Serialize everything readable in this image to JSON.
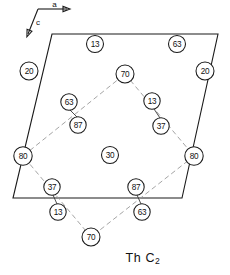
{
  "figure": {
    "caption_main": "Th C",
    "caption_sub": "2",
    "caption_full": "Th C2"
  },
  "axes": {
    "a_label": "a",
    "c_label": "c",
    "origin": {
      "x": 38,
      "y": 9
    },
    "a_tip": {
      "x": 67,
      "y": 9
    },
    "c_tip": {
      "x": 28,
      "y": 34
    }
  },
  "unit_cell": {
    "shape": "parallelogram",
    "stroke": "#1a1a1a",
    "vertices": [
      {
        "x": 52,
        "y": 34
      },
      {
        "x": 218,
        "y": 34
      },
      {
        "x": 182,
        "y": 198
      },
      {
        "x": 13,
        "y": 198
      }
    ]
  },
  "diamond": {
    "stroke": "#9a9a9a",
    "style": "dashed",
    "vertices": [
      {
        "x": 125,
        "y": 74
      },
      {
        "x": 194,
        "y": 156
      },
      {
        "x": 91,
        "y": 237
      },
      {
        "x": 23,
        "y": 156
      }
    ]
  },
  "atoms": [
    {
      "id": "a1",
      "label": "13",
      "x": 95,
      "y": 44,
      "r": 8.5
    },
    {
      "id": "a2",
      "label": "63",
      "x": 177,
      "y": 44,
      "r": 8.5
    },
    {
      "id": "a3",
      "label": "20",
      "x": 29,
      "y": 71,
      "r": 9.0
    },
    {
      "id": "a4",
      "label": "20",
      "x": 205,
      "y": 71,
      "r": 9.0
    },
    {
      "id": "a5",
      "label": "70",
      "x": 125,
      "y": 74,
      "r": 9.0
    },
    {
      "id": "a6",
      "label": "63",
      "x": 69,
      "y": 102,
      "r": 8.2
    },
    {
      "id": "a7",
      "label": "13",
      "x": 152,
      "y": 101,
      "r": 8.2
    },
    {
      "id": "a8",
      "label": "87",
      "x": 78,
      "y": 125,
      "r": 8.2
    },
    {
      "id": "a9",
      "label": "37",
      "x": 161,
      "y": 126,
      "r": 8.2
    },
    {
      "id": "a10",
      "label": "80",
      "x": 23,
      "y": 156,
      "r": 9.2
    },
    {
      "id": "a11",
      "label": "30",
      "x": 110,
      "y": 155,
      "r": 8.5
    },
    {
      "id": "a12",
      "label": "80",
      "x": 194,
      "y": 156,
      "r": 9.2
    },
    {
      "id": "a13",
      "label": "37",
      "x": 52,
      "y": 187,
      "r": 8.2
    },
    {
      "id": "a14",
      "label": "87",
      "x": 136,
      "y": 187,
      "r": 8.2
    },
    {
      "id": "a15",
      "label": "13",
      "x": 58,
      "y": 212,
      "r": 8.2
    },
    {
      "id": "a16",
      "label": "63",
      "x": 142,
      "y": 212,
      "r": 8.2
    },
    {
      "id": "a17",
      "label": "70",
      "x": 91,
      "y": 237,
      "r": 9.0
    }
  ],
  "bonds": [
    {
      "from": "a6",
      "to": "a8",
      "x1": 70,
      "y1": 110,
      "x2": 77,
      "y2": 117
    },
    {
      "from": "a7",
      "to": "a9",
      "x1": 154,
      "y1": 109,
      "x2": 160,
      "y2": 118
    },
    {
      "from": "a13",
      "to": "a15",
      "x1": 53,
      "y1": 195,
      "x2": 57,
      "y2": 204
    },
    {
      "from": "a14",
      "to": "a16",
      "x1": 137,
      "y1": 195,
      "x2": 141,
      "y2": 204
    }
  ]
}
